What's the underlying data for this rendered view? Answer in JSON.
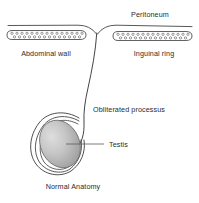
{
  "figure": {
    "title": "Normal Anatomy",
    "type": "anatomical-diagram",
    "background_color": "#ffffff",
    "line_color": "#3a3a3a",
    "text_color": "#2b2b2b",
    "testis_fill_light": "#d8d8d8",
    "testis_fill_dark": "#9a9a9a"
  },
  "labels": {
    "peritoneum": "Peritoneum",
    "abdominal_wall": "Abdominal wall",
    "inguinal_ring": "Inguinal ring",
    "obliterated_processus": "Obliterated processus",
    "testis": "Testis",
    "normal_anatomy": "Normal Anatomy"
  },
  "structures": {
    "abdominal_wall_pattern": "stippled-capsule",
    "inguinal_ring_pattern": "stippled-capsule",
    "processus": "single-curved-line",
    "tunica_coil": "three-concentric-arcs",
    "testis_shape": "tilted-ellipse"
  }
}
